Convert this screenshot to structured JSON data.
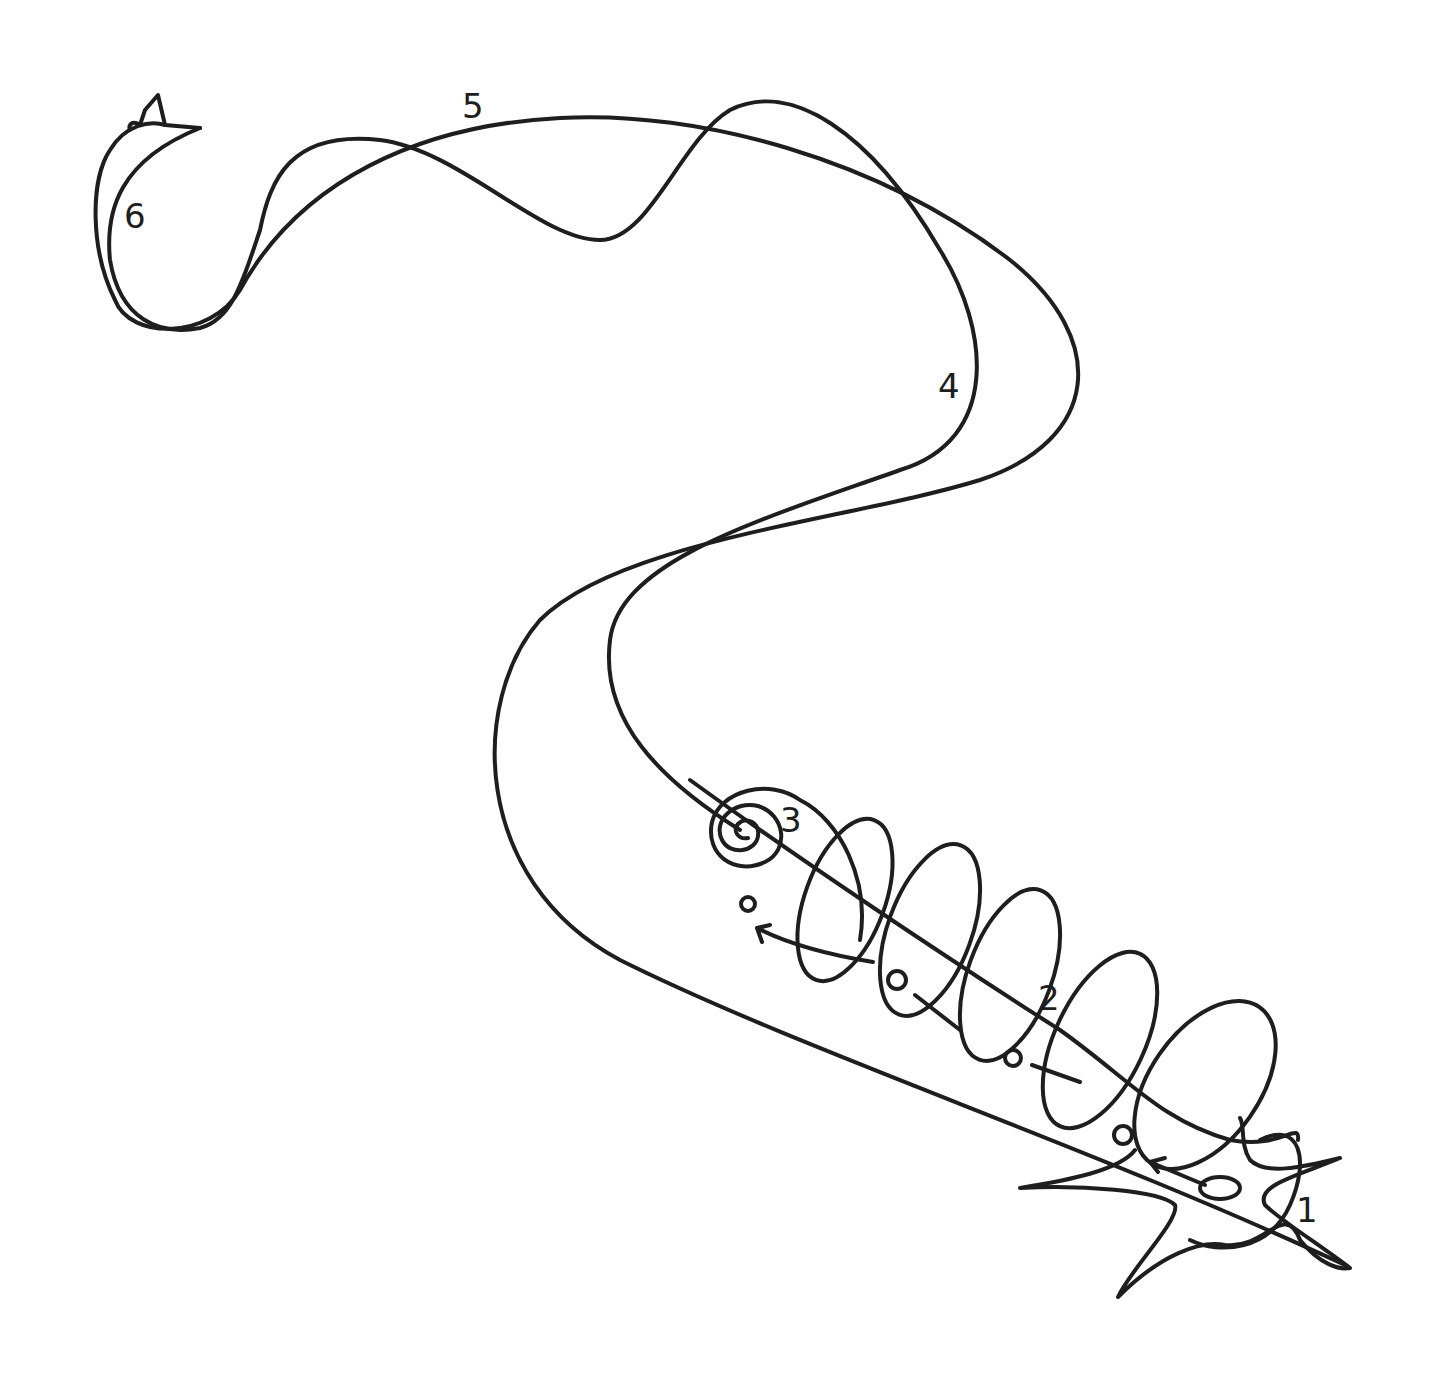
{
  "diagram": {
    "style": "hand-drawn line sketch",
    "stroke_color": "#1e1e1e",
    "background": "#ffffff",
    "labels": [
      {
        "id": "1",
        "text": "1",
        "x": 1300,
        "y": 1222
      },
      {
        "id": "2",
        "text": "2",
        "x": 1040,
        "y": 1010
      },
      {
        "id": "3",
        "text": "3",
        "x": 780,
        "y": 830
      },
      {
        "id": "4",
        "text": "4",
        "x": 940,
        "y": 395
      },
      {
        "id": "5",
        "text": "5",
        "x": 463,
        "y": 118
      },
      {
        "id": "6",
        "text": "6",
        "x": 125,
        "y": 228
      }
    ],
    "elements": [
      "star-shaped origin with circle (1)",
      "coiled helix along a path with small circles and arrows (2)",
      "spiral (3)",
      "large looping curve (4)",
      "wavy crossing path (5)",
      "leaf/flame shaped end form (6)"
    ]
  }
}
